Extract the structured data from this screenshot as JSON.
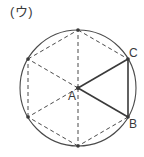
{
  "figure": {
    "panel_label": "(ウ)",
    "stroke_color": "#4a4a4a",
    "dash_color": "#4a4a4a",
    "background_color": "#ffffff",
    "circle": {
      "center_label": "A",
      "cx": 78,
      "cy": 88,
      "r": 58,
      "style": "solid"
    },
    "vertices": [
      {
        "name": "top",
        "label": "",
        "x": 78,
        "y": 30,
        "angle_deg": 90
      },
      {
        "name": "upper-right",
        "label": "C",
        "x": 128,
        "y": 59,
        "angle_deg": 30
      },
      {
        "name": "lower-right",
        "label": "B",
        "x": 128,
        "y": 117,
        "angle_deg": -30
      },
      {
        "name": "bottom",
        "label": "",
        "x": 78,
        "y": 146,
        "angle_deg": -90
      },
      {
        "name": "lower-left",
        "label": "",
        "x": 28,
        "y": 117,
        "angle_deg": 210
      },
      {
        "name": "upper-left",
        "label": "",
        "x": 28,
        "y": 59,
        "angle_deg": 150
      }
    ],
    "center_point": {
      "label": "A",
      "x": 78,
      "y": 88
    },
    "hexagon_sides": [
      {
        "from": "top",
        "to": "upper-right",
        "style": "dashed"
      },
      {
        "from": "upper-right",
        "to": "lower-right",
        "style": "solid"
      },
      {
        "from": "lower-right",
        "to": "bottom",
        "style": "dashed"
      },
      {
        "from": "bottom",
        "to": "lower-left",
        "style": "dashed"
      },
      {
        "from": "lower-left",
        "to": "upper-left",
        "style": "dashed"
      },
      {
        "from": "upper-left",
        "to": "top",
        "style": "dashed"
      }
    ],
    "radii": [
      {
        "to": "top",
        "style": "dashed"
      },
      {
        "to": "upper-right",
        "style": "solid"
      },
      {
        "to": "lower-right",
        "style": "solid"
      },
      {
        "to": "bottom",
        "style": "dashed"
      },
      {
        "to": "lower-left",
        "style": "dashed"
      },
      {
        "to": "upper-left",
        "style": "dashed"
      }
    ],
    "point_labels": {
      "center": "A",
      "lower_right": "B",
      "upper_right": "C"
    }
  }
}
